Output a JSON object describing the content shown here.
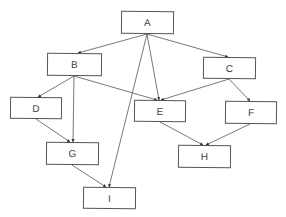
{
  "diagram": {
    "type": "directed-graph",
    "colors": {
      "stroke": "#555555",
      "text": "#444444",
      "background": "#ffffff"
    },
    "nodes": [
      {
        "id": "A",
        "label": "A",
        "x": 121,
        "y": 11,
        "w": 53,
        "h": 23
      },
      {
        "id": "B",
        "label": "B",
        "x": 47,
        "y": 53,
        "w": 55,
        "h": 23
      },
      {
        "id": "C",
        "label": "C",
        "x": 203,
        "y": 57,
        "w": 53,
        "h": 22
      },
      {
        "id": "D",
        "label": "D",
        "x": 10,
        "y": 97,
        "w": 52,
        "h": 22
      },
      {
        "id": "E",
        "label": "E",
        "x": 134,
        "y": 100,
        "w": 52,
        "h": 22
      },
      {
        "id": "F",
        "label": "F",
        "x": 225,
        "y": 101,
        "w": 52,
        "h": 23
      },
      {
        "id": "G",
        "label": "G",
        "x": 46,
        "y": 142,
        "w": 53,
        "h": 23
      },
      {
        "id": "H",
        "label": "H",
        "x": 178,
        "y": 145,
        "w": 53,
        "h": 23
      },
      {
        "id": "I",
        "label": "I",
        "x": 83,
        "y": 187,
        "w": 53,
        "h": 22
      }
    ],
    "edges": [
      {
        "from": "A",
        "to": "B",
        "x1": 147,
        "y1": 34,
        "x2": 78,
        "y2": 53
      },
      {
        "from": "A",
        "to": "C",
        "x1": 147,
        "y1": 34,
        "x2": 228,
        "y2": 57
      },
      {
        "from": "A",
        "to": "E",
        "x1": 147,
        "y1": 34,
        "x2": 159,
        "y2": 100
      },
      {
        "from": "A",
        "to": "I",
        "x1": 147,
        "y1": 34,
        "x2": 109,
        "y2": 187
      },
      {
        "from": "B",
        "to": "D",
        "x1": 74,
        "y1": 76,
        "x2": 38,
        "y2": 97
      },
      {
        "from": "B",
        "to": "G",
        "x1": 74,
        "y1": 76,
        "x2": 73,
        "y2": 142
      },
      {
        "from": "B",
        "to": "E",
        "x1": 74,
        "y1": 76,
        "x2": 157,
        "y2": 100
      },
      {
        "from": "C",
        "to": "E",
        "x1": 229,
        "y1": 79,
        "x2": 161,
        "y2": 100
      },
      {
        "from": "C",
        "to": "F",
        "x1": 229,
        "y1": 79,
        "x2": 250,
        "y2": 101
      },
      {
        "from": "D",
        "to": "G",
        "x1": 36,
        "y1": 119,
        "x2": 70,
        "y2": 142
      },
      {
        "from": "E",
        "to": "H",
        "x1": 160,
        "y1": 122,
        "x2": 203,
        "y2": 145
      },
      {
        "from": "F",
        "to": "H",
        "x1": 250,
        "y1": 124,
        "x2": 206,
        "y2": 145
      },
      {
        "from": "G",
        "to": "I",
        "x1": 72,
        "y1": 165,
        "x2": 106,
        "y2": 187
      }
    ]
  }
}
